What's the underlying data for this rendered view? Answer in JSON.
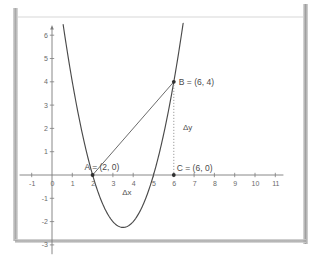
{
  "chart_data": {
    "type": "line",
    "title": "",
    "xlabel": "",
    "ylabel": "",
    "xlim": [
      -1.6,
      11.4
    ],
    "ylim": [
      -3.4,
      6.4
    ],
    "grid": false,
    "legend": null,
    "series": [
      {
        "name": "parabola",
        "kind": "curve",
        "expression": "y = (x - 2)(x - 5)",
        "roots": [
          2,
          5
        ],
        "vertex": [
          3.5,
          -2.25
        ],
        "x": [
          0.55,
          1.0,
          1.5,
          2.0,
          2.5,
          3.0,
          3.5,
          4.0,
          4.5,
          5.0,
          5.5,
          6.0,
          6.45
        ],
        "y": [
          6.0,
          4.0,
          1.75,
          0.0,
          -1.25,
          -2.0,
          -2.25,
          -2.0,
          -1.25,
          0.0,
          1.75,
          4.0,
          6.0
        ]
      },
      {
        "name": "secant-line",
        "kind": "segment",
        "from": [
          2,
          0
        ],
        "to": [
          6,
          4
        ]
      },
      {
        "name": "delta-y-dotted",
        "kind": "segment-dotted",
        "from": [
          6,
          4
        ],
        "to": [
          6,
          0
        ]
      }
    ],
    "points": [
      {
        "id": "A",
        "x": 2,
        "y": 0,
        "label": "A = (2, 0)"
      },
      {
        "id": "B",
        "x": 6,
        "y": 4,
        "label": "B = (6, 4)"
      },
      {
        "id": "C",
        "x": 6,
        "y": 0,
        "label": "C = (6, 0)"
      }
    ],
    "annotations": [
      {
        "id": "delta-y",
        "text": "Δy",
        "x": 6.45,
        "y": 2.0
      },
      {
        "id": "delta-x",
        "text": "Δx",
        "x": 3.75,
        "y": -0.62
      }
    ],
    "x_ticks": [
      -1,
      0,
      1,
      2,
      3,
      4,
      5,
      6,
      7,
      8,
      9,
      10,
      11
    ],
    "x_tick_labels": [
      "-1",
      "0",
      "1",
      "2",
      "3",
      "4",
      "5",
      "6",
      "7",
      "8",
      "9",
      "10",
      "11"
    ],
    "y_ticks": [
      -3,
      -2,
      -1,
      1,
      2,
      3,
      4,
      5,
      6
    ],
    "y_tick_labels": [
      "-3",
      "-2",
      "-1",
      "1",
      "2",
      "3",
      "4",
      "5",
      "6"
    ],
    "colors": {
      "curve": "#4a4a4a",
      "secant": "#5a5a5a",
      "dotted": "#8a8a8a",
      "axis": "#7c7c7c",
      "text": "#565656",
      "background": "#ffffff"
    }
  }
}
